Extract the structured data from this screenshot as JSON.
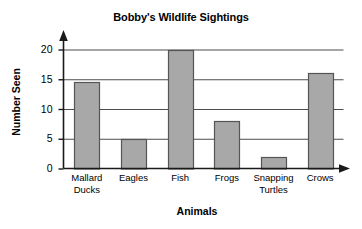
{
  "chart_data": {
    "type": "bar",
    "title": "Bobby's Wildlife Sightings",
    "xlabel": "Animals",
    "ylabel": "Number Seen",
    "categories": [
      "Mallard Ducks",
      "Eagles",
      "Fish",
      "Frogs",
      "Snapping Turtles",
      "Crows"
    ],
    "category_lines": [
      [
        "Mallard",
        "Ducks"
      ],
      [
        "Eagles",
        ""
      ],
      [
        "Fish",
        ""
      ],
      [
        "Frogs",
        ""
      ],
      [
        "Snapping",
        "Turtles"
      ],
      [
        "Crows",
        ""
      ]
    ],
    "values": [
      14.5,
      5,
      20,
      8,
      2,
      16
    ],
    "ylim": [
      0,
      20
    ],
    "yticks": [
      0,
      5,
      10,
      15,
      20
    ],
    "ytick_labels": [
      "0",
      "5",
      "10",
      "15",
      "20"
    ],
    "grid": true,
    "grid_axis": "y",
    "legend": false,
    "bar_fill": "#a8a8a8",
    "bar_stroke": "#555555",
    "axis_color": "#1a1a1a",
    "grid_color": "#4d4d4d",
    "background": "#ffffff",
    "y_axis_arrow": true,
    "x_axis_arrow": true
  }
}
